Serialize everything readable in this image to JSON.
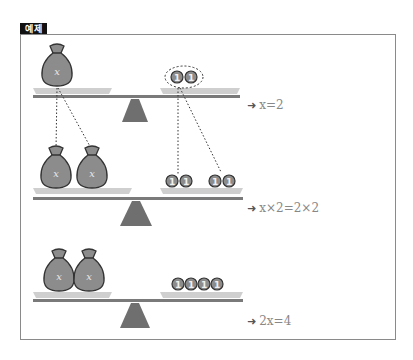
{
  "header": {
    "badge_label": "예제"
  },
  "colors": {
    "beam": "#7a7a7a",
    "pan": "#cfcfcf",
    "fulcrum": "#6f6f6f",
    "bag_fill": "#8c8c8c",
    "bag_stroke": "#333333",
    "coin_fill": "#8c8c8c",
    "equation_text": "#888888"
  },
  "scales": [
    {
      "left_pan": {
        "bags": 1,
        "bag_label": "x"
      },
      "right_pan": {
        "coins": 2,
        "coin_label": "1",
        "grouped": true
      },
      "equation": {
        "arrow": "➜",
        "text": "x=2"
      }
    },
    {
      "left_pan": {
        "bags": 2,
        "bag_label": "x"
      },
      "right_pan": {
        "coins": 4,
        "coin_label": "1",
        "grouped": false
      },
      "equation": {
        "arrow": "➜",
        "text": "x×2=2×2"
      }
    },
    {
      "left_pan": {
        "bags": 2,
        "bag_label": "x"
      },
      "right_pan": {
        "coins": 4,
        "coin_label": "1",
        "grouped": false
      },
      "equation": {
        "arrow": "➜",
        "text": "2x=4"
      }
    }
  ]
}
